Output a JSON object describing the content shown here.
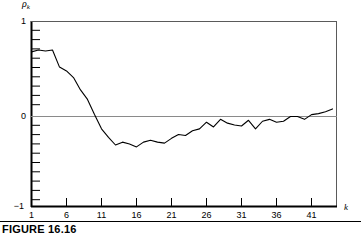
{
  "figure": {
    "caption": "FIGURE 16.16",
    "y_axis_title": "ρ",
    "y_axis_title_sub": "k",
    "x_axis_title": "k"
  },
  "chart_data": {
    "type": "line",
    "title": "",
    "subtitle": "",
    "xlabel": "k",
    "ylabel": "ρ̂k",
    "grid": false,
    "legend": null,
    "zero_line": 0,
    "xlim": [
      0,
      44.5
    ],
    "ylim": [
      -1,
      1
    ],
    "xticks": [
      1,
      6,
      11,
      16,
      21,
      26,
      31,
      36,
      41
    ],
    "xtick_labels": [
      "1",
      "6",
      "11",
      "16",
      "21",
      "26",
      "31",
      "36",
      "41"
    ],
    "yticks": [
      -1,
      0,
      1
    ],
    "ytick_labels": [
      "−1",
      "0",
      "1"
    ],
    "yminor_step": 0.1,
    "series": [
      {
        "name": "sample autocorrelation",
        "x": [
          1,
          2,
          3,
          4,
          5,
          6,
          7,
          8,
          9,
          10,
          11,
          12,
          13,
          14,
          15,
          16,
          17,
          18,
          19,
          20,
          21,
          22,
          23,
          24,
          25,
          26,
          27,
          28,
          29,
          30,
          31,
          32,
          33,
          34,
          35,
          36,
          37,
          38,
          39,
          40,
          41,
          42,
          43,
          44
        ],
        "values": [
          0.68,
          0.7,
          0.69,
          0.7,
          0.52,
          0.48,
          0.41,
          0.28,
          0.18,
          0.02,
          -0.13,
          -0.22,
          -0.3,
          -0.27,
          -0.29,
          -0.32,
          -0.27,
          -0.25,
          -0.27,
          -0.28,
          -0.23,
          -0.19,
          -0.2,
          -0.15,
          -0.13,
          -0.06,
          -0.11,
          -0.03,
          -0.07,
          -0.09,
          -0.1,
          -0.04,
          -0.13,
          -0.05,
          -0.03,
          -0.06,
          -0.05,
          0.0,
          0.0,
          -0.03,
          0.02,
          0.03,
          0.05,
          0.08
        ]
      }
    ]
  }
}
